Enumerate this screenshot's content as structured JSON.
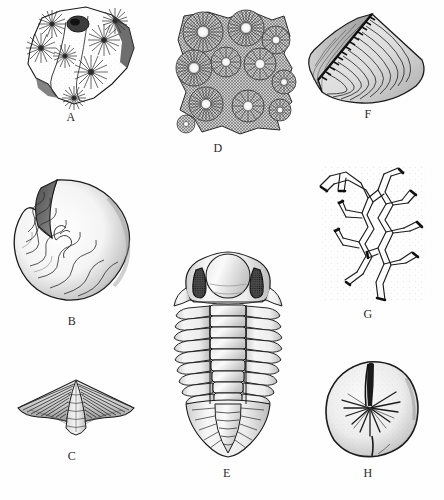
{
  "plate": {
    "title": "Invertebrate fossil plate",
    "background_color": "#fefefe",
    "ink_color": "#1b1b1b",
    "width": 444,
    "height": 500
  },
  "specimens": [
    {
      "label": "A",
      "name": "colonial-coral-slab",
      "description": "Rock slab with star-shaped radiating corallites",
      "label_x": 71,
      "label_y": 116
    },
    {
      "label": "B",
      "name": "coiled-cephalopod",
      "description": "Coiled nautiloid shell with zigzag suture lines",
      "label_x": 72,
      "label_y": 320
    },
    {
      "label": "C",
      "name": "spiriferid-brachiopod",
      "description": "Winged brachiopod with radial ribs",
      "label_x": 72,
      "label_y": 455
    },
    {
      "label": "D",
      "name": "favositid-coral-colony",
      "description": "Colonial coral with radiating septa around pale calices",
      "label_x": 218,
      "label_y": 147
    },
    {
      "label": "E",
      "name": "trilobite",
      "description": "Trilobite with glabella, compound eyes and segmented thorax",
      "label_x": 227,
      "label_y": 472
    },
    {
      "label": "F",
      "name": "bivalve-shell",
      "description": "Bivalve shell with concentric growth lines and toothed hinge",
      "label_x": 368,
      "label_y": 113
    },
    {
      "label": "G",
      "name": "branching-bryozoan",
      "description": "Branching bryozoan colony with tubular stems",
      "label_x": 368,
      "label_y": 313
    },
    {
      "label": "H",
      "name": "rugose-coral-section",
      "description": "Solitary rugose coral cross-section with radiating septa",
      "label_x": 368,
      "label_y": 472
    }
  ]
}
